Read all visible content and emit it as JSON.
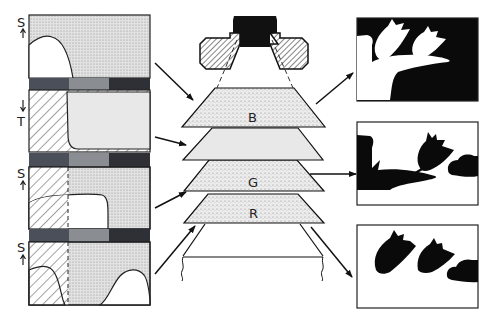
{
  "diagram": {
    "title": "",
    "left_panels": [
      {
        "axis_label": "S",
        "arrow_dir": "up"
      },
      {
        "axis_label": "T",
        "arrow_dir": "down"
      },
      {
        "axis_label": "S",
        "arrow_dir": "up"
      },
      {
        "axis_label": "S",
        "arrow_dir": "up"
      }
    ],
    "layers": [
      {
        "label": "B"
      },
      {
        "label": ""
      },
      {
        "label": "G"
      },
      {
        "label": "R"
      }
    ],
    "color_bar_segments": [
      "#4a4f5a",
      "#8a8d92",
      "#2e3036"
    ],
    "colors": {
      "stipple_bg": "#dcdcdc",
      "light_gray_layer": "#e6e6e6",
      "ink": "#111111"
    }
  }
}
